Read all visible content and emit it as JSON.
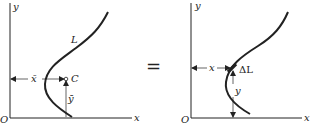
{
  "left_panel": {
    "y_axis_label": "y",
    "x_axis_label": "x",
    "origin_label": "O",
    "curve_label": "L",
    "centroid_label": "C",
    "x_bar_label": "x̄",
    "y_bar_label": "ȳ"
  },
  "equals_sign": "=",
  "right_panel": {
    "y_axis_label": "y",
    "x_axis_label": "x",
    "origin_label": "O",
    "element_label": "ΔL",
    "x_label": "x",
    "y_label": "y"
  },
  "colors": {
    "line": "#222222",
    "background": "#ffffff"
  }
}
